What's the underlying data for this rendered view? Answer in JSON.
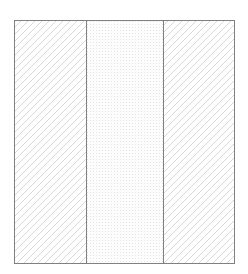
{
  "figure": {
    "kind": "cross-section-diagram",
    "title": "",
    "background_color": "#ffffff",
    "canvas": {
      "width": 248,
      "height": 274
    }
  },
  "outline": {
    "name": "section-outline-rectangle",
    "x": 14,
    "y": 20,
    "width": 220,
    "height": 243,
    "stroke_color": "#808080",
    "stroke_width": 1,
    "fill": "none"
  },
  "dividers": [
    {
      "name": "divider-left",
      "x": 86,
      "y_top": 20,
      "y_bottom": 263,
      "stroke_color": "#808080",
      "stroke_width": 1
    },
    {
      "name": "divider-right",
      "x": 163,
      "y_top": 20,
      "y_bottom": 263,
      "stroke_color": "#808080",
      "stroke_width": 1
    }
  ],
  "regions": [
    {
      "name": "region-left-hatched",
      "label": "",
      "x": 14,
      "y": 20,
      "width": 72,
      "height": 243,
      "fill_pattern": "diagonal-hatch-45",
      "pattern_color": "#d8d8d8",
      "pattern_spacing": 7,
      "pattern_line_width": 1,
      "background_color": "#ffffff"
    },
    {
      "name": "region-center-stippled",
      "label": "",
      "x": 86,
      "y": 20,
      "width": 77,
      "height": 243,
      "fill_pattern": "fine-dot-stipple",
      "pattern_color": "#e3e3e3",
      "pattern_spacing": 3,
      "pattern_line_width": 1,
      "background_color": "#fdfdfd"
    },
    {
      "name": "region-right-hatched",
      "label": "",
      "x": 163,
      "y": 20,
      "width": 71,
      "height": 243,
      "fill_pattern": "diagonal-hatch-45",
      "pattern_color": "#d8d8d8",
      "pattern_spacing": 7,
      "pattern_line_width": 1,
      "background_color": "#ffffff"
    }
  ]
}
